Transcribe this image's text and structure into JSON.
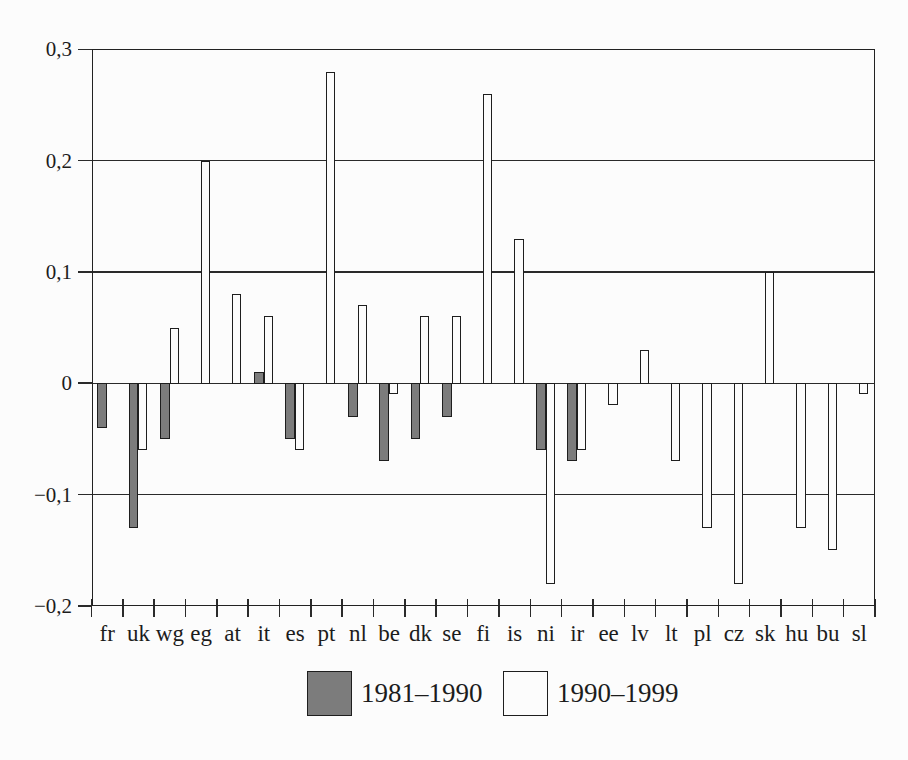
{
  "figure": {
    "background": "#fcfcfc",
    "line_color": "#2a2a2a",
    "text_color": "#1c1c1c"
  },
  "chart_data": {
    "type": "bar",
    "title": "",
    "xlabel": "",
    "ylabel": "",
    "categories": [
      "fr",
      "uk",
      "wg",
      "eg",
      "at",
      "it",
      "es",
      "pt",
      "nl",
      "be",
      "dk",
      "se",
      "fi",
      "is",
      "ni",
      "ir",
      "ee",
      "lv",
      "lt",
      "pl",
      "cz",
      "sk",
      "hu",
      "bu",
      "sl"
    ],
    "series": [
      {
        "name": "1981–1990",
        "color": "#7c7c7c",
        "values": [
          -0.04,
          -0.13,
          -0.05,
          null,
          null,
          0.01,
          -0.05,
          null,
          -0.03,
          -0.07,
          -0.05,
          -0.03,
          null,
          null,
          -0.06,
          -0.07,
          null,
          null,
          null,
          null,
          null,
          null,
          null,
          null,
          null
        ]
      },
      {
        "name": "1990–1999",
        "color": "#fcfcfc",
        "values": [
          null,
          -0.06,
          0.05,
          0.2,
          0.08,
          0.06,
          -0.06,
          0.28,
          0.07,
          -0.01,
          0.06,
          0.06,
          0.26,
          0.13,
          -0.18,
          -0.06,
          -0.02,
          0.03,
          -0.07,
          -0.13,
          -0.18,
          0.1,
          -0.13,
          -0.15,
          -0.01
        ]
      }
    ],
    "ylim": [
      -0.2,
      0.3
    ],
    "ytick_interval": 0.1,
    "yticks": [
      0.3,
      0.2,
      0.1,
      0,
      -0.1,
      -0.2
    ],
    "ytick_labels": [
      "0,3",
      "0,2",
      "0,1",
      "0",
      "−0,1",
      "−0,2"
    ],
    "decimal_separator": ",",
    "grid": true,
    "legend_position": "bottom"
  },
  "legend": {
    "items": [
      {
        "label": "1981–1990"
      },
      {
        "label": "1990–1999"
      }
    ]
  }
}
